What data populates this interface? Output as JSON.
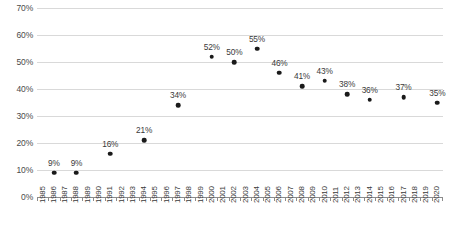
{
  "chart_data": {
    "type": "scatter",
    "title": "",
    "subtitle": "",
    "xlabel": "",
    "ylabel": "",
    "ylim": [
      0,
      70
    ],
    "ytick_labels": [
      "0%",
      "10%",
      "20%",
      "30%",
      "40%",
      "50%",
      "60%",
      "70%"
    ],
    "ytick_values": [
      0,
      10,
      20,
      30,
      40,
      50,
      60,
      70
    ],
    "grid": true,
    "legend": "none",
    "x_axis_range": [
      1985,
      2020
    ],
    "xtick_labels": [
      "1985",
      "1986",
      "1987",
      "1988",
      "1989",
      "1990",
      "1991",
      "1992",
      "1993",
      "1994",
      "1995",
      "1996",
      "1997",
      "1998",
      "1999",
      "2000",
      "2001",
      "2002",
      "2003",
      "2004",
      "2005",
      "2006",
      "2007",
      "2008",
      "2009",
      "2010",
      "2011",
      "2012",
      "2013",
      "2014",
      "2015",
      "2016",
      "2017",
      "2018",
      "2019",
      "2020"
    ],
    "point_color": "#1a1a1a",
    "gridline_color": "#d9d9d9",
    "axis_color": "#8c8c8c",
    "points": [
      {
        "x": 1986,
        "y": 9,
        "label": "9%"
      },
      {
        "x": 1988,
        "y": 9,
        "label": "9%"
      },
      {
        "x": 1991,
        "y": 16,
        "label": "16%"
      },
      {
        "x": 1994,
        "y": 21,
        "label": "21%"
      },
      {
        "x": 1997,
        "y": 34,
        "label": "34%"
      },
      {
        "x": 2000,
        "y": 52,
        "label": "52%"
      },
      {
        "x": 2002,
        "y": 50,
        "label": "50%"
      },
      {
        "x": 2004,
        "y": 55,
        "label": "55%"
      },
      {
        "x": 2006,
        "y": 46,
        "label": "46%"
      },
      {
        "x": 2008,
        "y": 41,
        "label": "41%"
      },
      {
        "x": 2010,
        "y": 43,
        "label": "43%"
      },
      {
        "x": 2012,
        "y": 38,
        "label": "38%"
      },
      {
        "x": 2014,
        "y": 36,
        "label": "36%"
      },
      {
        "x": 2017,
        "y": 37,
        "label": "37%"
      },
      {
        "x": 2020,
        "y": 35,
        "label": "35%"
      }
    ]
  }
}
